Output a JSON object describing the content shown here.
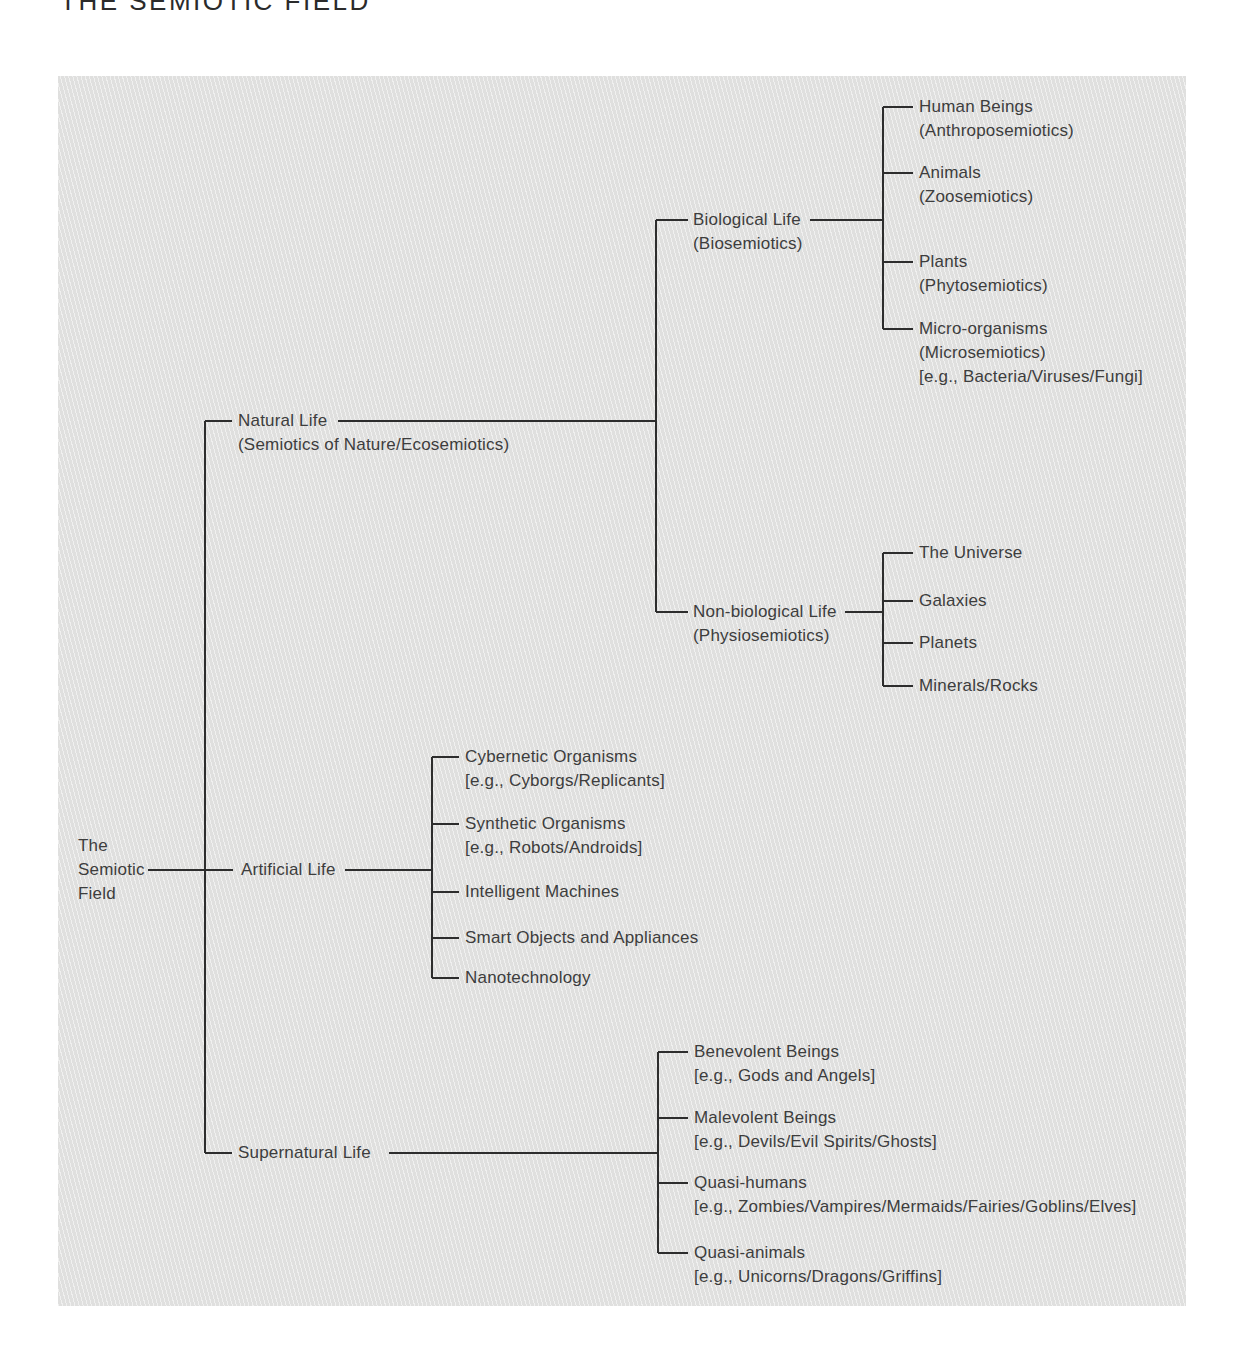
{
  "page_title": "THE SEMIOTIC FIELD",
  "colors": {
    "page_background": "#ffffff",
    "panel_background": "#e3e3e2",
    "line_color": "#2d2d2d",
    "text_color": "#3d3d3d"
  },
  "tree": {
    "root": {
      "label": "The Semiotic Field",
      "lines": [
        "The",
        "Semiotic",
        "Field"
      ]
    },
    "branches": [
      {
        "label": "Natural Life",
        "sub": "(Semiotics of Nature/Ecosemiotics)",
        "children": [
          {
            "label": "Biological Life",
            "sub": "(Biosemiotics)",
            "children": [
              {
                "label": "Human Beings",
                "sub": "(Anthroposemiotics)"
              },
              {
                "label": "Animals",
                "sub": "(Zoosemiotics)"
              },
              {
                "label": "Plants",
                "sub": "(Phytosemiotics)"
              },
              {
                "label": "Micro-organisms",
                "sub": "(Microsemiotics)",
                "eg": "[e.g., Bacteria/Viruses/Fungi]"
              }
            ]
          },
          {
            "label": "Non-biological Life",
            "sub": "(Physiosemiotics)",
            "children": [
              {
                "label": "The Universe"
              },
              {
                "label": "Galaxies"
              },
              {
                "label": "Planets"
              },
              {
                "label": "Minerals/Rocks"
              }
            ]
          }
        ]
      },
      {
        "label": "Artificial Life",
        "children": [
          {
            "label": "Cybernetic Organisms",
            "eg": "[e.g., Cyborgs/Replicants]"
          },
          {
            "label": "Synthetic Organisms",
            "eg": "[e.g., Robots/Androids]"
          },
          {
            "label": "Intelligent Machines"
          },
          {
            "label": "Smart Objects and Appliances"
          },
          {
            "label": "Nanotechnology"
          }
        ]
      },
      {
        "label": "Supernatural Life",
        "children": [
          {
            "label": "Benevolent Beings",
            "eg": "[e.g., Gods and Angels]"
          },
          {
            "label": "Malevolent Beings",
            "eg": "[e.g., Devils/Evil Spirits/Ghosts]"
          },
          {
            "label": "Quasi-humans",
            "eg": "[e.g., Zombies/Vampires/Mermaids/Fairies/Goblins/Elves]"
          },
          {
            "label": "Quasi-animals",
            "eg": "[e.g., Unicorns/Dragons/Griffins]"
          }
        ]
      }
    ]
  }
}
